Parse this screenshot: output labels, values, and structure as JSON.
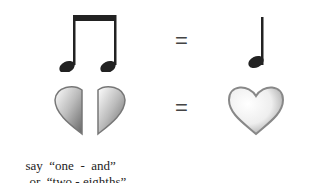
{
  "rows": [
    {
      "left": "two-eighth-notes-beamed",
      "operator": "=",
      "right": "quarter-note"
    },
    {
      "left": "two-half-hearts",
      "operator": "=",
      "right": "whole-heart"
    }
  ],
  "caption": {
    "line1_prefix": "say",
    "line1_quote": "“one  -  and”",
    "line2_prefix": "or",
    "line2_quote": "“two - eighths”"
  },
  "colors": {
    "note": "#222222",
    "heart_rim": "#888888",
    "heart_fill": "#f4f4f4"
  }
}
